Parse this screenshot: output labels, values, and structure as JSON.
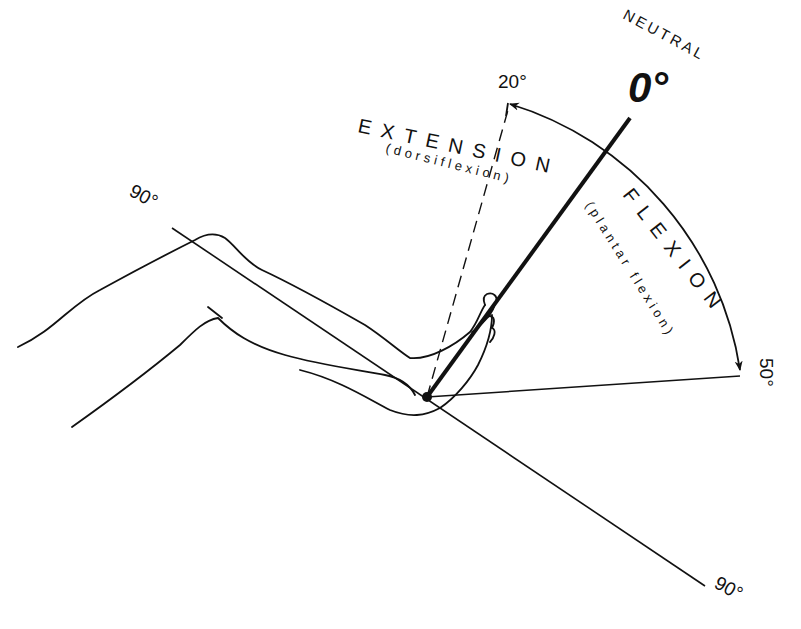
{
  "diagram": {
    "neutral": {
      "label": "NEUTRAL",
      "value": "0°"
    },
    "extension": {
      "label": "EXTENSION",
      "sublabel": "(dorsiflexion)",
      "angle": "20°"
    },
    "flexion": {
      "label": "FLEXION",
      "sublabel": "(plantar flexion)",
      "angle": "50°"
    },
    "reference_line": {
      "start_label": "90°",
      "end_label": "90°"
    },
    "colors": {
      "ink": "#111111",
      "background": "#ffffff"
    }
  }
}
